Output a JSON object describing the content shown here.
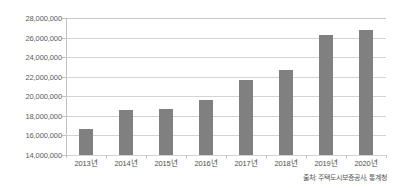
{
  "chart_data": {
    "type": "bar",
    "title": "",
    "subtitle": "",
    "xlabel": "",
    "ylabel": "",
    "categories": [
      "2013년",
      "2014년",
      "2015년",
      "2016년",
      "2017년",
      "2018년",
      "2019년",
      "2020년"
    ],
    "values": [
      16650000,
      18550000,
      18750000,
      19600000,
      21700000,
      22700000,
      26300000,
      26750000
    ],
    "ylim": [
      14000000,
      28000000
    ],
    "ytick_values": [
      14000000,
      16000000,
      18000000,
      20000000,
      22000000,
      24000000,
      26000000,
      28000000
    ],
    "ytick_labels": [
      "14,000,000",
      "16,000,000",
      "18,000,000",
      "20,000,000",
      "22,000,000",
      "24,000,000",
      "26,000,000",
      "28,000,000"
    ],
    "grid": true,
    "legend": false,
    "legend_position": "none",
    "series": [
      {
        "name": "",
        "color": "#808080",
        "values": [
          16650000,
          18550000,
          18750000,
          19600000,
          21700000,
          22700000,
          26300000,
          26750000
        ]
      }
    ],
    "annotations": []
  },
  "source_note": "출처: 주택도시보증공사, 통계청",
  "colors": {
    "bar": "#808080",
    "gridline": "#d3d3d3",
    "axis": "#c0c0c0",
    "tick_text": "#5a5a5a",
    "background": "#ffffff"
  }
}
